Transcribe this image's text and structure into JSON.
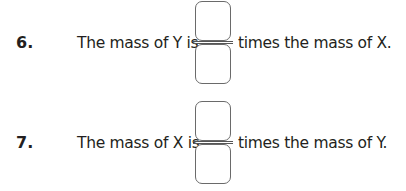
{
  "questions": [
    {
      "number": "6.",
      "text_before": "The mass of Y is",
      "text_after": "times the mass of X.",
      "answer": {
        "numerator": "",
        "denominator": ""
      }
    },
    {
      "number": "7.",
      "text_before": "The mass of X is",
      "text_after": "times the mass of Y.",
      "answer": {
        "numerator": "",
        "denominator": ""
      }
    }
  ],
  "colors": {
    "text": "#231f20",
    "box_border": "#6a6a6a"
  }
}
